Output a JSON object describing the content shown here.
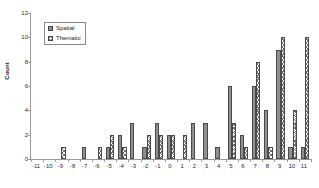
{
  "chart_data": {
    "type": "bar",
    "title": "",
    "xlabel": "",
    "ylabel": "Count",
    "ylim": [
      0,
      12
    ],
    "yticks": [
      0,
      2,
      4,
      6,
      8,
      10,
      12
    ],
    "grid": false,
    "legend_position": "top-left",
    "categories": [
      "-11",
      "-10",
      "-9",
      "-8",
      "-7",
      "-6",
      "-5",
      "-4",
      "-3",
      "-2",
      "-1",
      "0",
      "1",
      "2",
      "3",
      "4",
      "5",
      "6",
      "7",
      "8",
      "9",
      "10",
      "11"
    ],
    "series": [
      {
        "name": "Spatial",
        "color": "#8f8f8f",
        "pattern": "solid",
        "values": [
          0,
          0,
          0,
          0,
          1,
          0,
          1,
          2,
          3,
          1,
          3,
          2,
          0,
          3,
          3,
          1,
          6,
          2,
          6,
          4,
          9,
          1,
          1
        ]
      },
      {
        "name": "Thematic",
        "color": "#6e6e6e",
        "pattern": "crosshatch",
        "values": [
          0,
          0,
          1,
          0,
          0,
          1,
          2,
          1,
          0,
          2,
          2,
          2,
          2,
          0,
          0,
          0,
          3,
          1,
          8,
          1,
          10,
          4,
          10
        ]
      }
    ]
  },
  "legend": {
    "items": [
      {
        "label": "Spatial"
      },
      {
        "label": "Thematic"
      }
    ]
  },
  "axis": {
    "y_title": "Count"
  }
}
